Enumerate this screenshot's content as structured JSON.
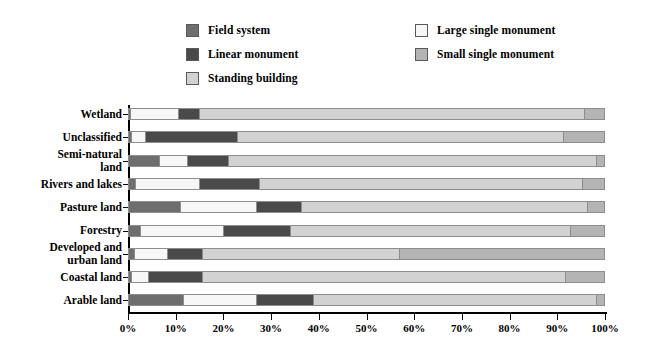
{
  "legend": {
    "columns": [
      [
        {
          "label": "Field system",
          "color": "#6e6e6e",
          "swatch": "field-system-swatch"
        },
        {
          "label": "Linear monument",
          "color": "#4a4a4a",
          "swatch": "linear-monument-swatch"
        },
        {
          "label": "Standing building",
          "color": "#d2d2d2",
          "swatch": "standing-building-swatch"
        }
      ],
      [
        {
          "label": "Large single monument",
          "color": "#f7f7f7",
          "swatch": "large-single-monument-swatch"
        },
        {
          "label": "Small single monument",
          "color": "#b4b4b4",
          "swatch": "small-single-monument-swatch"
        }
      ]
    ]
  },
  "axis": {
    "x_ticks": [
      "0%",
      "10%",
      "20%",
      "30%",
      "40%",
      "50%",
      "60%",
      "70%",
      "80%",
      "90%",
      "100%"
    ]
  },
  "chart_data": {
    "type": "bar",
    "orientation": "horizontal",
    "stacked": true,
    "normalized": true,
    "title": "",
    "xlabel": "",
    "ylabel": "",
    "xlim": [
      0,
      100
    ],
    "grid": false,
    "legend_position": "top",
    "categories": [
      "Wetland",
      "Unclassified",
      "Semi-natural land",
      "Rivers and lakes",
      "Pasture land",
      "Forestry",
      "Developed and urban land",
      "Coastal land",
      "Arable land"
    ],
    "category_labels": [
      "Wetland",
      "Unclassified",
      "Semi-natural\nland",
      "Rivers and lakes",
      "Pasture land",
      "Forestry",
      "Developed and\nurban land",
      "Coastal land",
      "Arable land"
    ],
    "series": [
      {
        "name": "Field system",
        "color": "#6e6e6e",
        "values": [
          0.4,
          0.6,
          6.5,
          1.5,
          11.0,
          2.5,
          1.2,
          0.6,
          11.5
        ]
      },
      {
        "name": "Large single monument",
        "color": "#f7f7f7",
        "values": [
          10.1,
          3.0,
          6.0,
          13.5,
          16.0,
          17.5,
          7.0,
          3.6,
          15.5
        ]
      },
      {
        "name": "Linear monument",
        "color": "#4a4a4a",
        "values": [
          4.5,
          19.4,
          8.5,
          12.5,
          9.5,
          14.0,
          7.3,
          11.3,
          12.0
        ]
      },
      {
        "name": "Standing building",
        "color": "#d2d2d2",
        "values": [
          81.0,
          68.5,
          77.5,
          68.0,
          60.2,
          59.0,
          41.5,
          76.5,
          59.5
        ]
      },
      {
        "name": "Small single monument",
        "color": "#b4b4b4",
        "values": [
          4.0,
          8.5,
          1.5,
          4.5,
          3.3,
          7.0,
          43.0,
          8.0,
          1.5
        ]
      }
    ]
  }
}
